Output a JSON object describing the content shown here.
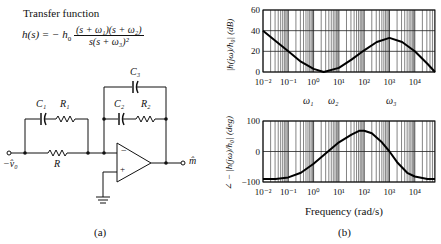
{
  "panel_a": {
    "title": "Transfer function",
    "equation": {
      "lhs": "h(s) = − h",
      "lhs_sub": "0",
      "numerator": "(s + ω₁)(s + ω₂)",
      "denominator": "s(s + ω₃)²"
    },
    "components": {
      "C1": "C₁",
      "R1": "R₁",
      "C2": "C₂",
      "R2": "R₂",
      "C3": "C₃",
      "R": "R"
    },
    "input_label": "−v̂₀",
    "output_label": "m̂",
    "opamp_minus": "−",
    "opamp_plus": "+",
    "caption": "(a)"
  },
  "panel_b": {
    "caption": "(b)",
    "xlabel": "Frequency (rad/s)",
    "omega_labels": [
      "ω₁",
      "ω₂",
      "ω₃"
    ]
  },
  "chart_data": [
    {
      "type": "line",
      "title": "Magnitude",
      "xlabel": "",
      "ylabel": "|h(jω)/h₀| (dB)",
      "xscale": "log",
      "x_ticks": [
        "10⁻²",
        "10⁻¹",
        "10⁰",
        "10¹",
        "10²",
        "10³",
        "10⁴"
      ],
      "y_ticks": [
        "0",
        "20",
        "40",
        "60"
      ],
      "ylim": [
        0,
        60
      ],
      "xlim_log10": [
        -2,
        4.8
      ],
      "grid": true,
      "annotations": [
        "ω₁",
        "ω₂",
        "ω₃"
      ],
      "series": [
        {
          "name": "magnitude",
          "log10_x": [
            -2,
            -1.5,
            -1,
            -0.5,
            0,
            0.4,
            1,
            1.5,
            2,
            2.5,
            3,
            3.5,
            4,
            4.5,
            4.8
          ],
          "y": [
            40,
            30,
            20,
            10,
            3,
            0,
            4,
            12,
            21,
            29,
            33,
            29,
            20,
            8,
            0
          ]
        }
      ]
    },
    {
      "type": "line",
      "title": "Phase",
      "xlabel": "Frequency (rad/s)",
      "ylabel": "∠ − |h(jω)/h₀| (deg)",
      "xscale": "log",
      "x_ticks": [
        "10⁻²",
        "10⁻¹",
        "10⁰",
        "10¹",
        "10²",
        "10³",
        "10⁴"
      ],
      "y_ticks": [
        "−100",
        "0",
        "100"
      ],
      "ylim": [
        -100,
        100
      ],
      "xlim_log10": [
        -2,
        4.8
      ],
      "grid": true,
      "series": [
        {
          "name": "phase",
          "log10_x": [
            -2,
            -1.5,
            -1,
            -0.5,
            0,
            0.5,
            1,
            1.5,
            1.8,
            2,
            2.3,
            2.7,
            3,
            3.3,
            3.7,
            4,
            4.5,
            4.8
          ],
          "y": [
            -90,
            -90,
            -85,
            -70,
            -40,
            -5,
            30,
            55,
            68,
            68,
            60,
            30,
            0,
            -35,
            -70,
            -82,
            -90,
            -90
          ]
        }
      ]
    }
  ]
}
